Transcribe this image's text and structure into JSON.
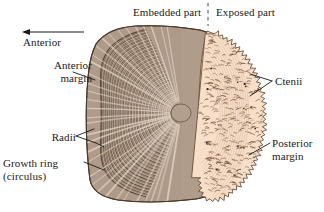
{
  "figure": {
    "background_color": "#ffffff"
  },
  "labels": {
    "embedded_part": "Embedded part",
    "exposed_part": "Exposed part",
    "anterior": "Anterior",
    "anterior_margin": "Anterior\nmargin",
    "radii": "Radii",
    "growth_ring": "Growth ring\n(circulus)",
    "ctenii": "Ctenii",
    "posterior_margin": "Posterior\nmargin"
  },
  "colors": {
    "embedded_fill": "#a79280",
    "embedded_ring_dark": "#5d4a3a",
    "embedded_ring_light": "#d9cbbb",
    "exposed_fill": "#f7ddc8",
    "exposed_tick": "#6b4a34",
    "outline": "#4a3a2c",
    "leader_line": "#1a1a1a",
    "text": "#1a1a1a",
    "divider_dash": "#555555"
  },
  "annotations": {
    "anterior_arrow_direction": "left",
    "divider_style": "vertical-dashed",
    "ctenii_leader": "two-pronged",
    "radii_leader": "two-pronged"
  }
}
